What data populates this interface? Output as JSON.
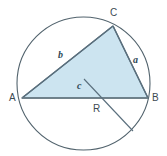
{
  "figure": {
    "background_color": "#ffffff",
    "stroke_color": "#52636d",
    "triangle_fill_color": "#cce4f0",
    "triangle_stroke_color": "#5a6f7d",
    "label_color": "#3b4a52",
    "circle": {
      "center_x": 83.5,
      "center_y": 83.5,
      "radius": 66.5
    },
    "vertices": {
      "A": {
        "label": "A",
        "x": 22,
        "y": 98
      },
      "B": {
        "label": "B",
        "x": 148,
        "y": 98
      },
      "C": {
        "label": "C",
        "x": 113,
        "y": 26
      }
    },
    "sides": {
      "a": {
        "label": "a",
        "from": "C",
        "to": "B"
      },
      "b": {
        "label": "b",
        "from": "A",
        "to": "C"
      },
      "c": {
        "label": "c",
        "from": "A",
        "to": "B"
      }
    },
    "radius_line": {
      "label": "R",
      "from_x": 84,
      "from_y": 79,
      "to_x": 133,
      "to_y": 131
    }
  }
}
